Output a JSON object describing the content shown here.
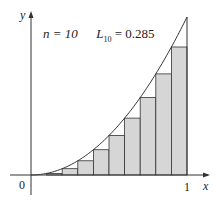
{
  "chart_data": {
    "type": "bar",
    "title": "n = 10   L10 = 0.285",
    "function": "y = x^2",
    "method": "left endpoint Riemann sum",
    "n": 10,
    "approximation_label": "L10 = 0.285",
    "categories": [
      "0.0",
      "0.1",
      "0.2",
      "0.3",
      "0.4",
      "0.5",
      "0.6",
      "0.7",
      "0.8",
      "0.9"
    ],
    "values": [
      0,
      0.01,
      0.04,
      0.09,
      0.16,
      0.25,
      0.36,
      0.49,
      0.64,
      0.81
    ],
    "xlabel": "x",
    "ylabel": "y",
    "xlim": [
      0,
      1
    ],
    "ylim": [
      0,
      1
    ],
    "x_ticks": [
      "0",
      "1"
    ],
    "grid": false,
    "colors": {
      "bar_fill": "#d6d6d6",
      "stroke": "#333333"
    }
  },
  "labels": {
    "n_text": "n = 10",
    "L_main": "L",
    "L_sub": "10",
    "L_value": " = 0.285",
    "x_axis": "x",
    "y_axis": "y",
    "origin": "0",
    "one": "1"
  }
}
